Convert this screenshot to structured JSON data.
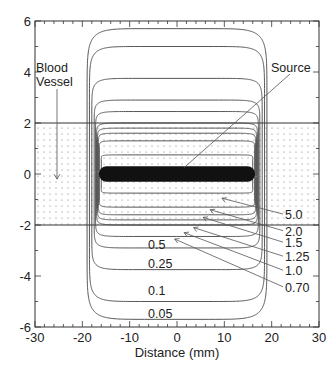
{
  "chart_data": {
    "type": "line",
    "title": "",
    "xlabel": "Distance (mm)",
    "ylabel": "",
    "xlim": [
      -30,
      30
    ],
    "ylim": [
      -6,
      6
    ],
    "x_ticks": [
      "-30",
      "-20",
      "-10",
      "0",
      "10",
      "20",
      "30"
    ],
    "y_ticks": [
      "6",
      "4",
      "2",
      "0",
      "-2",
      "-4",
      "-6"
    ],
    "grid": false,
    "legend": "none",
    "annotations": [
      {
        "text": "Blood Vessel",
        "points_to": [
          -25,
          0
        ]
      },
      {
        "text": "Source",
        "points_to": [
          0,
          0.3
        ]
      }
    ],
    "regions": [
      {
        "name": "Blood Vessel",
        "y_range": [
          -2,
          2
        ],
        "fill": "dotted"
      }
    ],
    "source": {
      "x_range": [
        -16.5,
        16.5
      ],
      "y": 0,
      "thickness": 0.6
    },
    "series": [
      {
        "name": "0.05",
        "level": 0.05,
        "half_width": 19.0,
        "half_height": 5.7
      },
      {
        "name": "0.1",
        "level": 0.1,
        "half_width": 18.5,
        "half_height": 5.0
      },
      {
        "name": "0.25",
        "level": 0.25,
        "half_width": 18.0,
        "half_height": 3.75
      },
      {
        "name": "0.5",
        "level": 0.5,
        "half_width": 17.5,
        "half_height": 2.9
      },
      {
        "name": "0.70",
        "level": 0.7,
        "half_width": 17.2,
        "half_height": 2.45
      },
      {
        "name": "1.0",
        "level": 1.0,
        "half_width": 17.0,
        "half_height": 2.0
      },
      {
        "name": "1.25",
        "level": 1.25,
        "half_width": 16.8,
        "half_height": 1.8
      },
      {
        "name": "1.5",
        "level": 1.5,
        "half_width": 16.6,
        "half_height": 1.6
      },
      {
        "name": "2.0",
        "level": 2.0,
        "half_width": 16.4,
        "half_height": 1.3
      },
      {
        "name": "5.0",
        "level": 5.0,
        "half_width": 16.0,
        "half_height": 0.75
      }
    ]
  },
  "labels": {
    "xlabel": "Distance (mm)",
    "blood": "Blood",
    "vessel": "Vessel",
    "source": "Source",
    "inner": [
      "0.5",
      "0.25",
      "0.1",
      "0.05"
    ],
    "outer": [
      "5.0",
      "2.0",
      "1.5",
      "1.25",
      "1.0",
      "0.70"
    ]
  }
}
